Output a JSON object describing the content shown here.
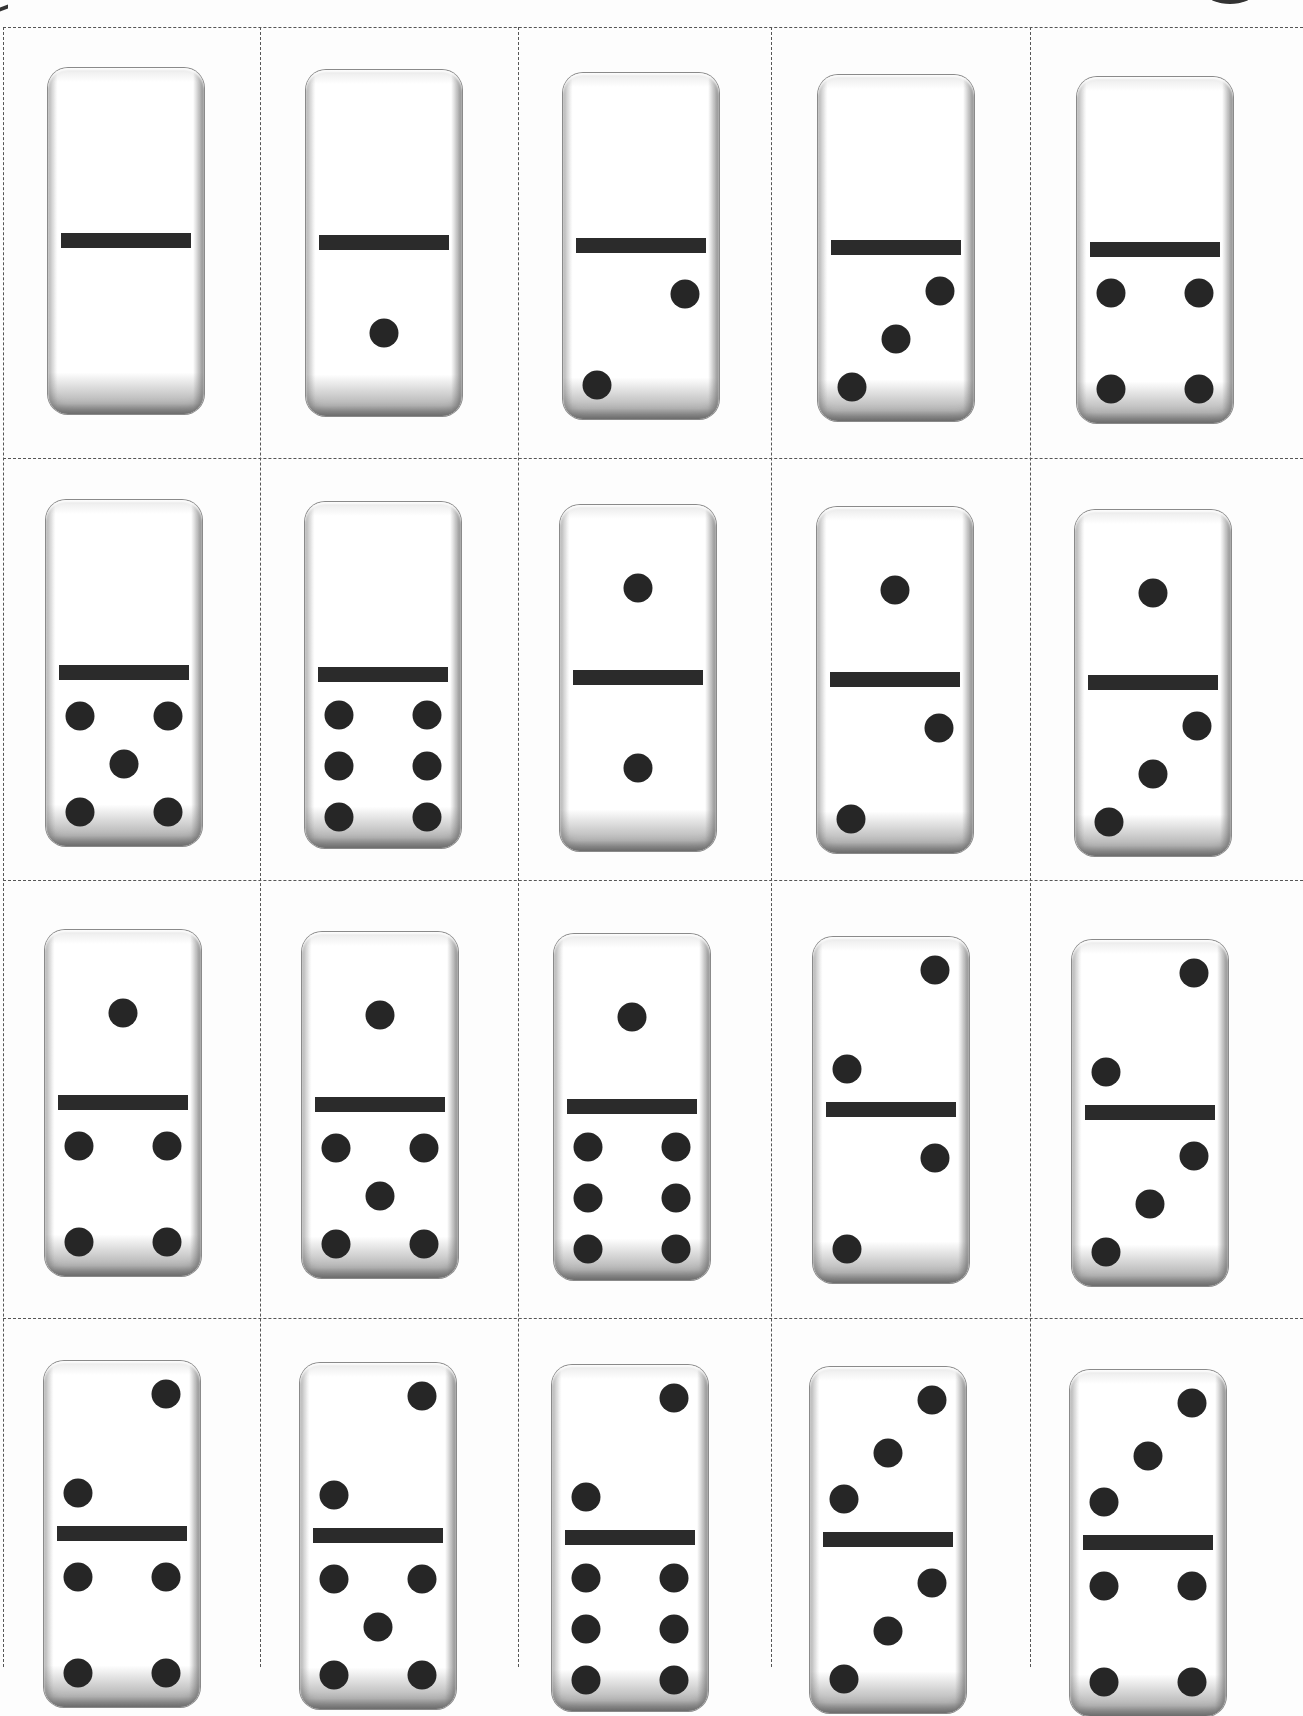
{
  "sheet": {
    "title": "Domino tiles printable sheet",
    "pip_color": "#262626",
    "bar_color": "#2b2b2b",
    "cut_line_color": "#555555"
  },
  "grid": {
    "columns": 5,
    "rows_visible": 4,
    "col_lines_x": [
      3,
      260,
      518,
      771,
      1030
    ],
    "row_lines_y": [
      27,
      458,
      880,
      1318
    ]
  },
  "tiles": [
    {
      "id": "0-0",
      "top": 0,
      "bottom": 0,
      "x": 48,
      "y": 68
    },
    {
      "id": "0-1",
      "top": 0,
      "bottom": 1,
      "x": 306,
      "y": 70
    },
    {
      "id": "0-2",
      "top": 0,
      "bottom": 2,
      "x": 563,
      "y": 73
    },
    {
      "id": "0-3",
      "top": 0,
      "bottom": 3,
      "x": 818,
      "y": 75
    },
    {
      "id": "0-4",
      "top": 0,
      "bottom": 4,
      "x": 1077,
      "y": 77
    },
    {
      "id": "0-5",
      "top": 0,
      "bottom": 5,
      "x": 46,
      "y": 500
    },
    {
      "id": "0-6",
      "top": 0,
      "bottom": 6,
      "x": 305,
      "y": 502
    },
    {
      "id": "1-1",
      "top": 1,
      "bottom": 1,
      "x": 560,
      "y": 505
    },
    {
      "id": "1-2",
      "top": 1,
      "bottom": 2,
      "x": 817,
      "y": 507
    },
    {
      "id": "1-3",
      "top": 1,
      "bottom": 3,
      "x": 1075,
      "y": 510
    },
    {
      "id": "1-4",
      "top": 1,
      "bottom": 4,
      "x": 45,
      "y": 930
    },
    {
      "id": "1-5",
      "top": 1,
      "bottom": 5,
      "x": 302,
      "y": 932
    },
    {
      "id": "1-6",
      "top": 1,
      "bottom": 6,
      "x": 554,
      "y": 934
    },
    {
      "id": "2-2",
      "top": 2,
      "bottom": 2,
      "x": 813,
      "y": 937
    },
    {
      "id": "2-3",
      "top": 2,
      "bottom": 3,
      "x": 1072,
      "y": 940
    },
    {
      "id": "2-4",
      "top": 2,
      "bottom": 4,
      "x": 44,
      "y": 1361
    },
    {
      "id": "2-5",
      "top": 2,
      "bottom": 5,
      "x": 300,
      "y": 1363
    },
    {
      "id": "2-6",
      "top": 2,
      "bottom": 6,
      "x": 552,
      "y": 1365
    },
    {
      "id": "3-3",
      "top": 3,
      "bottom": 3,
      "x": 810,
      "y": 1367
    },
    {
      "id": "3-4",
      "top": 3,
      "bottom": 4,
      "x": 1070,
      "y": 1370
    }
  ],
  "pip_layouts": {
    "0": [],
    "1": [
      [
        50,
        50
      ]
    ],
    "2": [
      [
        78,
        25
      ],
      [
        22,
        80
      ]
    ],
    "3": [
      [
        78,
        22
      ],
      [
        50,
        51
      ],
      [
        22,
        80
      ]
    ],
    "4": [
      [
        22,
        22
      ],
      [
        78,
        22
      ],
      [
        22,
        80
      ],
      [
        78,
        80
      ]
    ],
    "5": [
      [
        22,
        22
      ],
      [
        78,
        22
      ],
      [
        50,
        51
      ],
      [
        22,
        80
      ],
      [
        78,
        80
      ]
    ],
    "6": [
      [
        22,
        20
      ],
      [
        78,
        20
      ],
      [
        22,
        51
      ],
      [
        78,
        51
      ],
      [
        22,
        82
      ],
      [
        78,
        82
      ]
    ]
  },
  "pip_layouts_top": {
    "0": [],
    "1": [
      [
        50,
        50
      ]
    ],
    "2": [
      [
        78,
        20
      ],
      [
        22,
        80
      ]
    ],
    "3": [
      [
        78,
        20
      ],
      [
        50,
        52
      ],
      [
        22,
        80
      ]
    ]
  }
}
